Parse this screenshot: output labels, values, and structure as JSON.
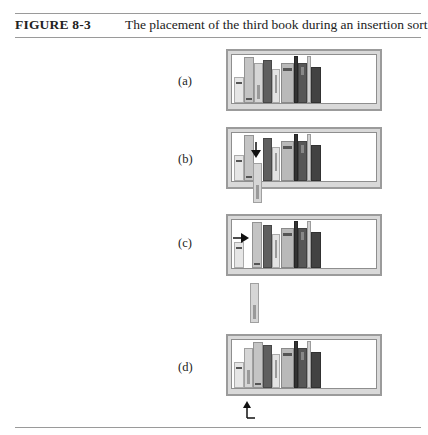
{
  "figure": {
    "number": "FIGURE 8-3",
    "title": "The placement of the third book during an insertion sort"
  },
  "panels": [
    {
      "label": "(a)",
      "step": "initial shelf"
    },
    {
      "label": "(b)",
      "step": "third book removed, arrow indicates gap"
    },
    {
      "label": "(c)",
      "step": "second book shifted right, arrow indicates move"
    },
    {
      "label": "(d)",
      "step": "third book inserted, arrow indicates insertion point"
    }
  ],
  "colors": {
    "frame": "#9b9b9b",
    "light_book": "#e2e2e2",
    "mid_book": "#bdbdbd",
    "dark_book": "#5a5a5a",
    "darkest_book": "#3a3a3a",
    "rule": "#9a9a9a"
  }
}
